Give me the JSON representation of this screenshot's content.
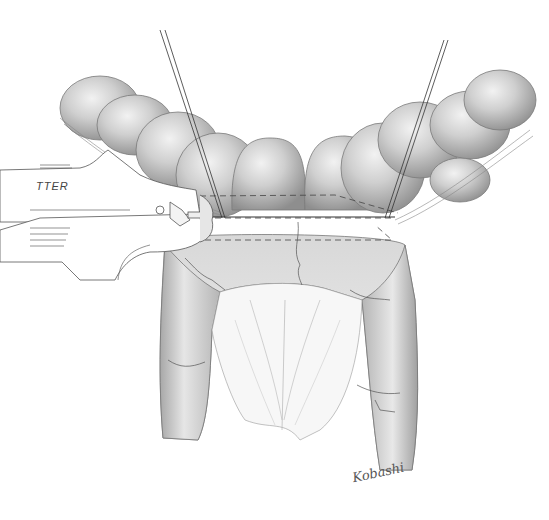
{
  "illustration": {
    "subject": "surgical stapler applied across bowel loop",
    "instrument_label": "TTER",
    "signature": "Kobashi",
    "colors": {
      "background": "#ffffff",
      "bowel_fill": "#c9c9c9",
      "bowel_shadow": "#9a9a9a",
      "bowel_highlight": "#eeeeee",
      "line": "#555555",
      "mesentery": "#f4f4f4"
    }
  }
}
